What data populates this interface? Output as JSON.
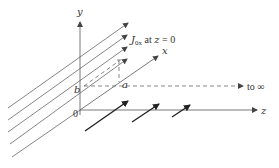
{
  "diagram": {
    "axes": {
      "y_label": "y",
      "x_label": "x",
      "z_label": "z",
      "origin_label": "0"
    },
    "dimensions": {
      "a_label": "a",
      "b_label": "b"
    },
    "annotations": {
      "current_sheet_main": "J",
      "current_sheet_sub": "0x",
      "current_sheet_rest": " at ",
      "current_sheet_var": "z",
      "current_sheet_eq": " = 0",
      "infinity_label": "to ∞"
    },
    "colors": {
      "line": "#555555",
      "bold_arrow": "#222222",
      "text": "#333333"
    }
  }
}
